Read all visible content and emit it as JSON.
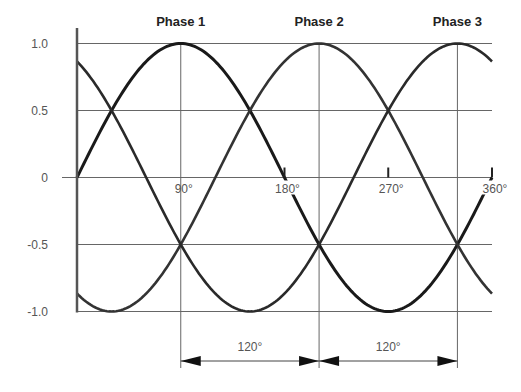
{
  "chart_data": {
    "type": "line",
    "title": "",
    "xlabel": "",
    "ylabel": "",
    "xlim": [
      0,
      360
    ],
    "ylim": [
      -1.0,
      1.0
    ],
    "grid": true,
    "y_ticks": [
      {
        "value": 1.0,
        "label": "1.0"
      },
      {
        "value": 0.5,
        "label": "0.5"
      },
      {
        "value": 0,
        "label": "0"
      },
      {
        "value": -0.5,
        "label": "-0.5"
      },
      {
        "value": -1.0,
        "label": "-1.0"
      }
    ],
    "x_ticks": [
      {
        "value": 90,
        "label": "90°"
      },
      {
        "value": 180,
        "label": "180°"
      },
      {
        "value": 270,
        "label": "270°"
      },
      {
        "value": 360,
        "label": "360°"
      }
    ],
    "series": [
      {
        "name": "Phase 1",
        "phase_shift_deg": 0,
        "peak_deg": 90,
        "function": "sin(x)",
        "color": "#1a1a1a"
      },
      {
        "name": "Phase 2",
        "phase_shift_deg": 120,
        "peak_deg": 210,
        "function": "sin(x-120)",
        "color": "#333333"
      },
      {
        "name": "Phase 3",
        "phase_shift_deg": 240,
        "peak_deg": 330,
        "function": "sin(x-240)",
        "color": "#2a2a2a"
      }
    ],
    "annotations": [
      {
        "type": "dimension",
        "from_deg": 90,
        "to_deg": 210,
        "label": "120°"
      },
      {
        "type": "dimension",
        "from_deg": 210,
        "to_deg": 330,
        "label": "120°"
      }
    ],
    "sample_points": {
      "x": [
        0,
        30,
        60,
        90,
        120,
        150,
        180,
        210,
        240,
        270,
        300,
        330,
        360
      ],
      "Phase 1": [
        0,
        0.5,
        0.866,
        1.0,
        0.866,
        0.5,
        0,
        -0.5,
        -0.866,
        -1.0,
        -0.866,
        -0.5,
        0
      ],
      "Phase 2": [
        -0.866,
        -0.5,
        0,
        0.5,
        0.866,
        1.0,
        0.866,
        0.5,
        0,
        -0.5,
        -0.866,
        -1.0,
        -0.866
      ],
      "Phase 3": [
        0.866,
        1.0,
        0.866,
        0.5,
        0,
        -0.5,
        -0.866,
        -1.0,
        -0.866,
        -0.5,
        0,
        0.5,
        0.866
      ]
    }
  }
}
